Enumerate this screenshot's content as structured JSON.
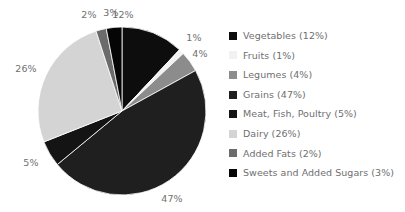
{
  "chart_data": {
    "type": "pie",
    "title": "",
    "subtitle": "",
    "xlabel": "",
    "ylabel": "",
    "legend_position": "right",
    "grid": false,
    "start_angle_deg": 0,
    "direction": "clockwise",
    "categories": [
      "Vegetables",
      "Fruits",
      "Legumes",
      "Grains",
      "Meat, Fish, Poultry",
      "Dairy",
      "Added Fats",
      "Sweets and Added Sugars"
    ],
    "values": [
      12,
      1,
      4,
      47,
      5,
      26,
      2,
      3
    ],
    "colors": [
      "#0d0d0d",
      "#f2f2f2",
      "#8c8c8c",
      "#1f1f1f",
      "#141414",
      "#d4d4d4",
      "#6b6b6b",
      "#050505"
    ],
    "slices": [
      {
        "name": "Vegetables",
        "value": 12,
        "label": "12%",
        "color": "#0d0d0d",
        "label_x": 123,
        "label_y": 15
      },
      {
        "name": "Fruits",
        "value": 1,
        "label": "1%",
        "color": "#f2f2f2",
        "label_x": 194,
        "label_y": 38
      },
      {
        "name": "Legumes",
        "value": 4,
        "label": "4%",
        "color": "#8c8c8c",
        "label_x": 200,
        "label_y": 54
      },
      {
        "name": "Grains",
        "value": 47,
        "label": "47%",
        "color": "#1f1f1f",
        "label_x": 172,
        "label_y": 199
      },
      {
        "name": "Meat, Fish, Poultry",
        "value": 5,
        "label": "5%",
        "color": "#141414",
        "label_x": 31,
        "label_y": 163
      },
      {
        "name": "Dairy",
        "value": 26,
        "label": "26%",
        "color": "#d4d4d4",
        "label_x": 26,
        "label_y": 69
      },
      {
        "name": "Added Fats",
        "value": 2,
        "label": "2%",
        "color": "#6b6b6b",
        "label_x": 89,
        "label_y": 15
      },
      {
        "name": "Sweets and Added Sugars",
        "value": 3,
        "label": "3%",
        "color": "#050505",
        "label_x": 111,
        "label_y": 13
      }
    ]
  },
  "legend": {
    "items": [
      {
        "label": "Vegetables (12%)",
        "swatch": "#0d0d0d",
        "icon": "legend-swatch-icon"
      },
      {
        "label": "Fruits (1%)",
        "swatch": "#f2f2f2",
        "icon": "legend-swatch-icon"
      },
      {
        "label": "Legumes (4%)",
        "swatch": "#8c8c8c",
        "icon": "legend-swatch-icon"
      },
      {
        "label": "Grains (47%)",
        "swatch": "#1f1f1f",
        "icon": "legend-swatch-icon"
      },
      {
        "label": "Meat, Fish, Poultry (5%)",
        "swatch": "#141414",
        "icon": "legend-swatch-icon"
      },
      {
        "label": "Dairy (26%)",
        "swatch": "#d4d4d4",
        "icon": "legend-swatch-icon"
      },
      {
        "label": "Added Fats (2%)",
        "swatch": "#6b6b6b",
        "icon": "legend-swatch-icon"
      },
      {
        "label": "Sweets and Added Sugars (3%)",
        "swatch": "#050505",
        "icon": "legend-swatch-icon"
      }
    ]
  },
  "geometry": {
    "center_x": 122,
    "center_y": 111,
    "radius": 84
  },
  "colors": {
    "background": "#ffffff",
    "label_text": "#6f6f6f",
    "slice_edge": "#ffffff"
  }
}
